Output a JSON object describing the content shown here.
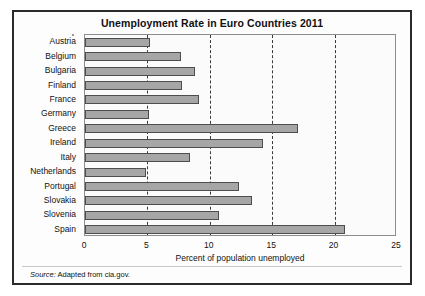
{
  "chart_data": {
    "type": "bar",
    "orientation": "horizontal",
    "title": "Unemployment Rate in Euro Countries 2011",
    "xlabel": "Percent of population unemployed",
    "ylabel": "",
    "categories": [
      "Austria",
      "Belgium",
      "Bulgaria",
      "Finland",
      "France",
      "Germany",
      "Greece",
      "Ireland",
      "Italy",
      "Netherlands",
      "Portugal",
      "Slovakia",
      "Slovenia",
      "Spain"
    ],
    "values": [
      5.2,
      7.7,
      8.8,
      7.8,
      9.1,
      5.1,
      17.1,
      14.3,
      8.4,
      4.9,
      12.3,
      13.4,
      10.7,
      20.8
    ],
    "xlim": [
      0,
      25
    ],
    "xticks": [
      0,
      5,
      10,
      15,
      20,
      25
    ],
    "xtick_labels": [
      "0",
      "5",
      "10",
      "15",
      "20",
      "25"
    ],
    "grid": "vertical-dashed",
    "legend": "none",
    "bar_color": "#a6a6a6",
    "bar_edge_color": "#4d4d4d",
    "frame_color": "#2b2b2b"
  },
  "source": {
    "key": "Source:",
    "text": " Adapted from cia.gov."
  }
}
